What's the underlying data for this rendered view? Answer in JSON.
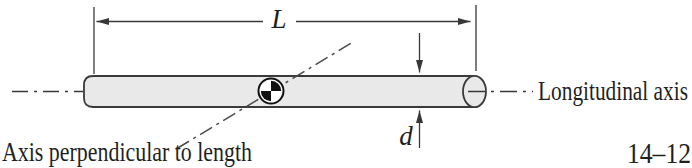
{
  "figure": {
    "number": "14–12",
    "labels": {
      "length": "L",
      "diameter": "d",
      "longitudinal_axis": "Longitudinal axis",
      "perpendicular_axis": "Axis perpendicular to length"
    },
    "icons": {
      "center_of_mass": "center-of-mass-symbol"
    },
    "colors": {
      "background": "#ffffff",
      "rod_fill": "#e9e9e9",
      "outline": "#3a3a3a",
      "text": "#1f1f1f"
    }
  }
}
